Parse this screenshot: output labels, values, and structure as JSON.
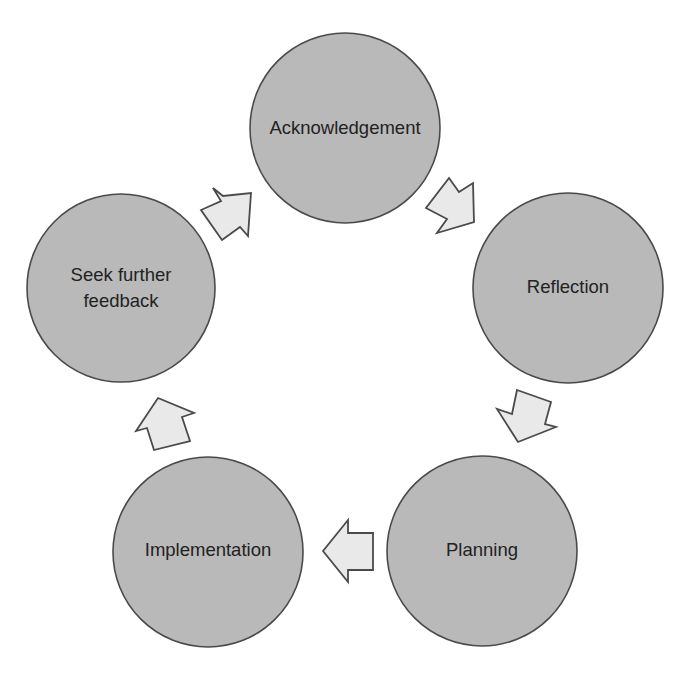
{
  "diagram": {
    "type": "cycle",
    "colors": {
      "background": "#ffffff",
      "node_fill": "#b9b9b9",
      "node_stroke": "#4a4a4a",
      "arrow_fill": "#e9e9e9",
      "arrow_stroke": "#4a4a4a",
      "text": "#222222"
    },
    "nodes": [
      {
        "id": "acknowledgement",
        "lines": [
          "Acknowledgement"
        ]
      },
      {
        "id": "reflection",
        "lines": [
          "Reflection"
        ]
      },
      {
        "id": "planning",
        "lines": [
          "Planning"
        ]
      },
      {
        "id": "implementation",
        "lines": [
          "Implementation"
        ]
      },
      {
        "id": "seek-further-feedback",
        "lines": [
          "Seek further",
          "feedback"
        ]
      }
    ],
    "edges": [
      {
        "from": "acknowledgement",
        "to": "reflection",
        "icon": "arrow-down-right-icon"
      },
      {
        "from": "reflection",
        "to": "planning",
        "icon": "arrow-down-left-icon"
      },
      {
        "from": "planning",
        "to": "implementation",
        "icon": "arrow-left-icon"
      },
      {
        "from": "implementation",
        "to": "seek-further-feedback",
        "icon": "arrow-up-left-icon"
      },
      {
        "from": "seek-further-feedback",
        "to": "acknowledgement",
        "icon": "arrow-up-right-icon"
      }
    ]
  }
}
